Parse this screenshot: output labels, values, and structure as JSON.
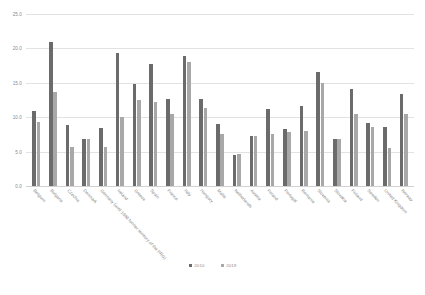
{
  "chart_data": {
    "type": "bar",
    "title": "",
    "subtitle": "",
    "xlabel": "",
    "ylabel": "",
    "ylim": [
      0.0,
      25.0
    ],
    "yticks": [
      "0.0",
      "5.0",
      "10.0",
      "15.0",
      "20.0",
      "25.0"
    ],
    "ytick_values": [
      0.0,
      5.0,
      10.0,
      15.0,
      20.0,
      25.0
    ],
    "grid": true,
    "legend_position": "bottom-center",
    "categories": [
      "Belgium",
      "Bulgaria",
      "Czechia",
      "Denmark",
      "Germany (until 1990 former territory of the FRG)",
      "Ireland",
      "Greece",
      "Spain",
      "France",
      "Italy",
      "Hungary",
      "Malta",
      "Netherlands",
      "Austria",
      "Poland",
      "Portugal",
      "Romania",
      "Slovenia",
      "Slovakia",
      "Finland",
      "Sweden",
      "United Kingdom",
      "Norway"
    ],
    "series": [
      {
        "name": "2010",
        "color": "#6b6b6b",
        "values": [
          10.9,
          21.0,
          8.8,
          6.8,
          8.4,
          19.4,
          14.9,
          17.7,
          12.7,
          18.9,
          12.6,
          9.0,
          4.5,
          7.3,
          11.2,
          8.3,
          11.6,
          16.5,
          6.9,
          14.1,
          9.2,
          8.6,
          13.4
        ]
      },
      {
        "name": "2019",
        "color": "#a8a8a8",
        "values": [
          9.3,
          13.7,
          5.7,
          6.8,
          5.6,
          10.1,
          12.5,
          12.2,
          10.5,
          18.0,
          11.3,
          7.6,
          4.6,
          7.3,
          7.5,
          7.8,
          8.0,
          15.0,
          6.9,
          10.4,
          8.6,
          5.5,
          10.4
        ]
      }
    ]
  },
  "legend": {
    "items": [
      {
        "label": "2010"
      },
      {
        "label": "2019"
      }
    ]
  }
}
